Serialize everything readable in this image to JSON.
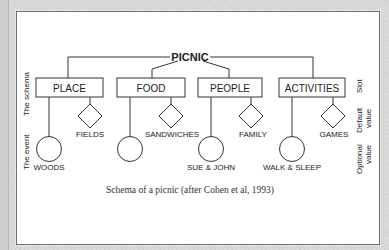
{
  "figure": {
    "root": "PICNIC",
    "slots": [
      {
        "label": "PLACE",
        "default_value": "FIELDS",
        "optional_value": "WOODS"
      },
      {
        "label": "FOOD",
        "default_value": "SANDWICHES",
        "optional_value": ""
      },
      {
        "label": "PEOPLE",
        "default_value": "FAMILY",
        "optional_value": "SUE & JOHN"
      },
      {
        "label": "ACTIVITIES",
        "default_value": "GAMES",
        "optional_value": "WALK & SLEEP"
      }
    ],
    "left_labels": {
      "schema": "The schema",
      "event": "The event"
    },
    "right_labels": {
      "slot": "Slot",
      "default_line1": "Default",
      "default_line2": "value",
      "optional_line1": "Optional",
      "optional_line2": "value"
    },
    "caption": "Schema of a picnic (after Cohen et al, 1993)"
  },
  "colors": {
    "line": "#333333",
    "panel": "#ffffff",
    "background": "#d9d9d9",
    "border": "#6e6e6e"
  }
}
